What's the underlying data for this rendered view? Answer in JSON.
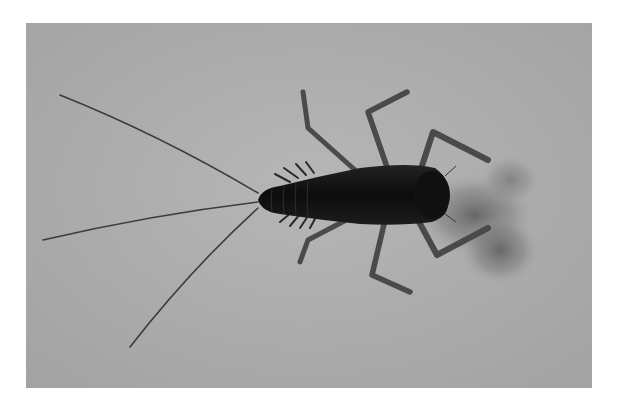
{
  "figure": {
    "style": "grayscale photograph",
    "colors": {
      "background": "#a8a8a8",
      "background_light": "#b4b4b4",
      "body": "#141414",
      "legs": "#4a4a4a",
      "shadow": "#6e6e6e",
      "page": "#ffffff"
    },
    "caption": ""
  }
}
